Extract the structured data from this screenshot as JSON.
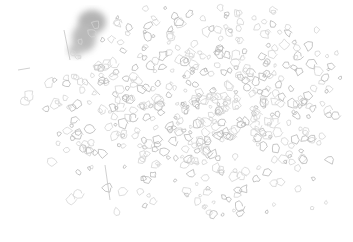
{
  "image": {
    "width": 353,
    "height": 242,
    "description": "Sparse edge-detected / sketch-like texture of scattered gray outlined blobs on white background, with a denser dark gray smudge near the top-left",
    "colors": {
      "background": "#ffffff",
      "stroke": "#b8b8b8",
      "stroke_light": "#d4d4d4",
      "dark_patch": "#8c8c8c"
    },
    "regions": [
      {
        "name": "dark-smudge",
        "x": 60,
        "y": 10,
        "w": 45,
        "h": 50
      },
      {
        "name": "dense-texture-center",
        "x": 100,
        "y": 60,
        "w": 200,
        "h": 150
      },
      {
        "name": "sparse-left-edge",
        "x": 10,
        "y": 60,
        "w": 60,
        "h": 150
      },
      {
        "name": "sparse-right-edge",
        "x": 300,
        "y": 30,
        "w": 45,
        "h": 180
      }
    ]
  }
}
